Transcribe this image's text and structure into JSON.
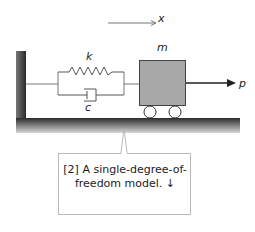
{
  "diagram": {
    "labels": {
      "displacement": "x",
      "stiffness": "k",
      "damping": "c",
      "mass": "m",
      "force": "p"
    },
    "colors": {
      "mass_fill": "#a8a8a8",
      "wall": "#444444",
      "ground_top": "#2a2a2a",
      "ground_bottom": "#d0d0d0",
      "stroke": "#333333"
    }
  },
  "callout": {
    "line1": "[2] A single-degree-of-",
    "line2": "freedom model. ↓"
  }
}
